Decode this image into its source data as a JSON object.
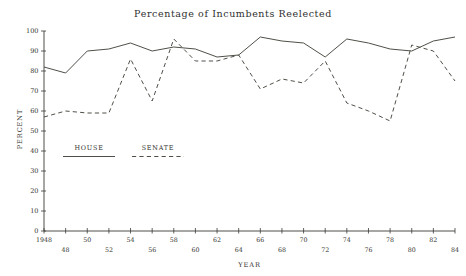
{
  "chart_data": {
    "type": "line",
    "title": "Percentage of Incumbents Reelected",
    "xlabel": "YEAR",
    "ylabel": "PERCENT",
    "xlim": [
      1948,
      1986
    ],
    "ylim": [
      0,
      100
    ],
    "grid": false,
    "legend_position": "inside-lower-left",
    "x": [
      1948,
      1950,
      1952,
      1954,
      1956,
      1958,
      1960,
      1962,
      1964,
      1966,
      1968,
      1970,
      1972,
      1974,
      1976,
      1978,
      1980,
      1982,
      1984,
      1986
    ],
    "series": [
      {
        "name": "HOUSE",
        "style": "solid",
        "values": [
          82,
          79,
          90,
          91,
          94,
          90,
          92,
          91,
          87,
          88,
          97,
          95,
          94,
          87,
          96,
          94,
          91,
          90,
          95,
          97
        ]
      },
      {
        "name": "SENATE",
        "style": "dashed",
        "values": [
          57,
          60,
          59,
          59,
          86,
          65,
          96,
          85,
          85,
          88,
          71,
          76,
          74,
          85,
          64,
          60,
          55,
          93,
          90,
          75
        ]
      }
    ],
    "y_ticks": [
      0,
      10,
      20,
      30,
      40,
      50,
      60,
      70,
      80,
      90,
      100
    ],
    "y_tick_labels": [
      "0",
      "10",
      "20",
      "30",
      "40",
      "50",
      "60",
      "70",
      "80",
      "90",
      "100"
    ],
    "x_ticks": [
      1948,
      1950,
      1952,
      1954,
      1956,
      1958,
      1960,
      1962,
      1964,
      1966,
      1968,
      1970,
      1972,
      1974,
      1976,
      1978,
      1980,
      1982,
      1984,
      1986
    ],
    "x_tick_labels": [
      "1948",
      "48",
      "50",
      "52",
      "54",
      "56",
      "58",
      "60",
      "62",
      "64",
      "66",
      "68",
      "70",
      "72",
      "74",
      "76",
      "78",
      "80",
      "82",
      "84",
      "86"
    ],
    "x_tick_labels_upper": [
      "1948",
      "50",
      "54",
      "58",
      "62",
      "66",
      "70",
      "74",
      "78",
      "82",
      "86"
    ],
    "x_tick_labels_lower": [
      "48",
      "52",
      "56",
      "60",
      "64",
      "68",
      "72",
      "76",
      "80",
      "84"
    ],
    "colors": {
      "line": "#46463f",
      "axis": "#3a3a36",
      "text": "#35352f",
      "background": "#ffffff"
    }
  },
  "legend": {
    "items": [
      {
        "label": "HOUSE",
        "style": "solid"
      },
      {
        "label": "SENATE",
        "style": "dashed"
      }
    ]
  }
}
